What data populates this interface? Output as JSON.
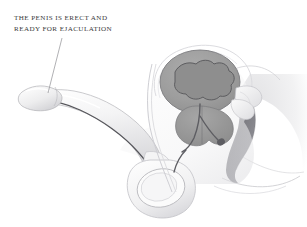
{
  "figure": {
    "background_color": "#ffffff",
    "ink_color": "#3b3b3b"
  },
  "caption": {
    "line1": "THE PENIS IS ERECT AND",
    "line2": "READY FOR EJACULATION",
    "x": 14,
    "y": 20,
    "line_height": 11
  },
  "leader_line": {
    "from_x": 62,
    "from_y": 38,
    "to_x": 48,
    "to_y": 93,
    "color": "#8f8f93",
    "width": 0.7
  },
  "palette": {
    "outline": "#6e6e72",
    "outline_soft": "#b4b4b8",
    "tissue_light": "#f4f4f5",
    "tissue_mid": "#e2e2e4",
    "organ_gray": "#9a9a9a",
    "organ_gray_dark": "#8a8a8a",
    "bladder_fill": "#a0a0a0",
    "rectum_dark": "#7e7e82",
    "urethra": "#55555a",
    "duct": "#5d5d62",
    "white": "#ffffff"
  },
  "structures": [
    {
      "name": "penis-shaft",
      "label": "Penile shaft",
      "fill": "#f2f2f3"
    },
    {
      "name": "glans",
      "label": "Glans penis",
      "fill": "#eeeeef"
    },
    {
      "name": "urethra",
      "label": "Urethra",
      "color": "#55555a"
    },
    {
      "name": "scrotum",
      "label": "Scrotum",
      "fill": "#f5f5f6"
    },
    {
      "name": "testis",
      "label": "Testis",
      "fill": "#fafafa"
    },
    {
      "name": "bladder",
      "label": "Bladder",
      "fill": "#a0a0a0"
    },
    {
      "name": "prostate",
      "label": "Prostate",
      "fill": "#9a9a9a"
    },
    {
      "name": "seminal-vesicle",
      "label": "Seminal vesicle",
      "fill": "#e8e8ea"
    },
    {
      "name": "vas-deferens",
      "label": "Vas deferens",
      "color": "#5d5d62"
    },
    {
      "name": "rectum",
      "label": "Rectum",
      "fill": "#7e7e82"
    },
    {
      "name": "pubic-bone",
      "label": "Pubic bone",
      "fill": "#f0f0f1"
    },
    {
      "name": "body-contour",
      "label": "Body contour",
      "color": "#c9c9cd"
    }
  ]
}
